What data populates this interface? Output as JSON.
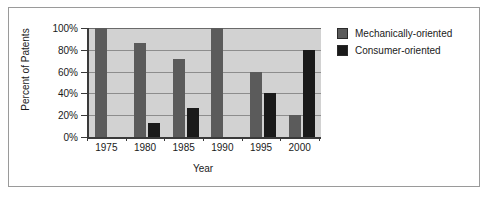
{
  "chart_data": {
    "type": "bar",
    "title": "",
    "xlabel": "Year",
    "ylabel": "Percent of Patents",
    "categories": [
      "1975",
      "1980",
      "1985",
      "1990",
      "1995",
      "2000"
    ],
    "series": [
      {
        "name": "Mechanically-oriented",
        "color": "#5b5b5b",
        "values": [
          100,
          86,
          72,
          100,
          60,
          20
        ]
      },
      {
        "name": "Consumer-oriented",
        "color": "#1a1a1a",
        "values": [
          0,
          13,
          27,
          0,
          40,
          80
        ]
      }
    ],
    "ylim": [
      0,
      100
    ],
    "ytick_labels": [
      "100%",
      "80%",
      "60%",
      "40%",
      "20%",
      "0%"
    ],
    "ytick_values": [
      100,
      80,
      60,
      40,
      20,
      0
    ],
    "grid": true,
    "legend_position": "right",
    "plot_background": "#d2d2d2"
  },
  "legend": {
    "items": [
      {
        "label": "Mechanically-oriented",
        "color": "#5b5b5b"
      },
      {
        "label": "Consumer-oriented",
        "color": "#1a1a1a"
      }
    ]
  },
  "axes": {
    "y_title": "Percent of Patents",
    "x_title": "Year"
  }
}
